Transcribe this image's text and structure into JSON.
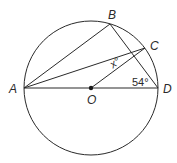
{
  "diagram": {
    "type": "circle-geometry",
    "colors": {
      "stroke": "#2a2a2a",
      "background": "#ffffff"
    },
    "circle": {
      "center": "O",
      "cx": 91,
      "cy": 88,
      "r": 67
    },
    "points": {
      "A": {
        "label": "A",
        "x": 24,
        "y": 88
      },
      "B": {
        "label": "B",
        "x": 110,
        "y": 24
      },
      "C": {
        "label": "C",
        "x": 145,
        "y": 48
      },
      "D": {
        "label": "D",
        "x": 158,
        "y": 88
      },
      "O": {
        "label": "O",
        "x": 91,
        "y": 88
      }
    },
    "segments": [
      "AB",
      "AC",
      "AD",
      "BD",
      "OC"
    ],
    "angles": {
      "x": {
        "label": "x°",
        "at": "angle between OC and AC"
      },
      "d": {
        "label": "54°",
        "at": "angle BDA at D"
      }
    }
  }
}
